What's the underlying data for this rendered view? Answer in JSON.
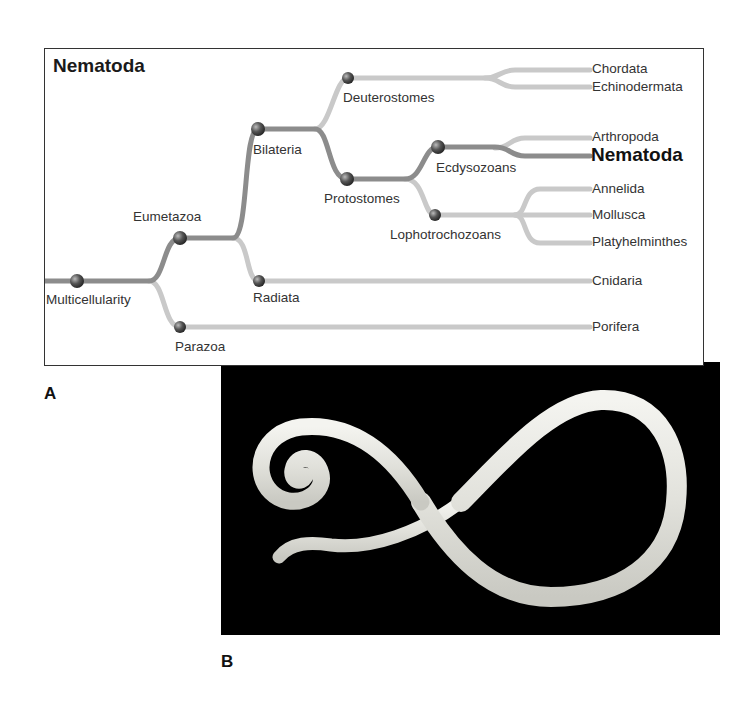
{
  "panel_a": {
    "title": "Nematoda",
    "letter": "A",
    "nodes": {
      "multicellularity": "Multicellularity",
      "eumetazoa": "Eumetazoa",
      "parazoa": "Parazoa",
      "bilateria": "Bilateria",
      "radiata": "Radiata",
      "deuterostomes": "Deuterostomes",
      "protostomes": "Protostomes",
      "ecdysozoans": "Ecdysozoans",
      "lophotrochozoans": "Lophotrochozoans"
    },
    "taxa": {
      "chordata": "Chordata",
      "echinodermata": "Echinodermata",
      "arthropoda": "Arthropoda",
      "nematoda": "Nematoda",
      "annelida": "Annelida",
      "mollusca": "Mollusca",
      "platyhelminthes": "Platyhelminthes",
      "cnidaria": "Cnidaria",
      "porifera": "Porifera"
    },
    "colors": {
      "highlight_branch": "#8a8a8a",
      "other_branch": "#c8c8c8",
      "node": "#555555"
    }
  },
  "panel_b": {
    "letter": "B",
    "description": "photograph of a nematode worm on black background"
  }
}
